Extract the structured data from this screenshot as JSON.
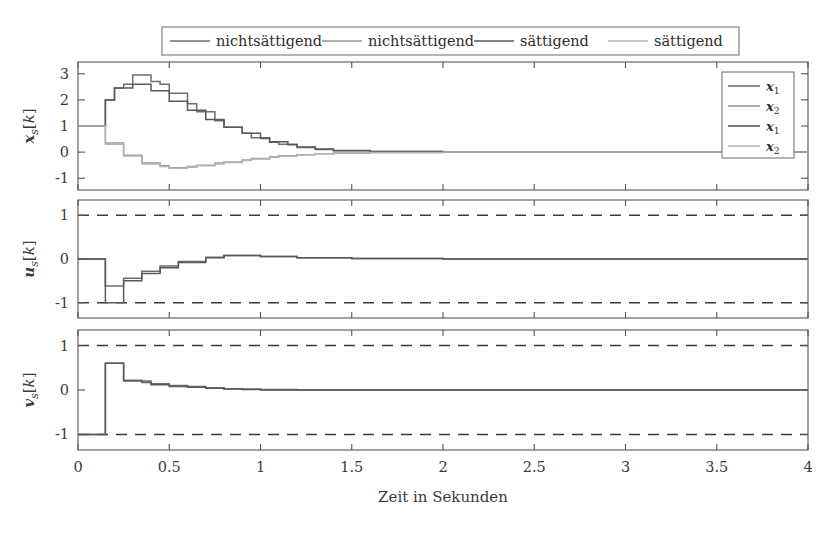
{
  "figure": {
    "width": 836,
    "height": 533,
    "background": "#ffffff",
    "xlabel": "Zeit in Sekunden"
  },
  "top_legend": {
    "entries": [
      {
        "label": "nichtsättigend",
        "color": "#6e6e6e"
      },
      {
        "label": "nichtsättigend",
        "color": "#9a9a9a"
      },
      {
        "label": "sättigend",
        "color": "#5a5a5a"
      },
      {
        "label": "sättigend",
        "color": "#b3b3b3"
      }
    ]
  },
  "inner_legend": {
    "entries": [
      {
        "label": "x1",
        "base": "x",
        "sub": "1",
        "color": "#6e6e6e"
      },
      {
        "label": "x2",
        "base": "x",
        "sub": "2",
        "color": "#9a9a9a"
      },
      {
        "label": "x1",
        "base": "x",
        "sub": "1",
        "color": "#5a5a5a"
      },
      {
        "label": "x2",
        "base": "x",
        "sub": "2",
        "color": "#b3b3b3"
      }
    ]
  },
  "chart_data": {
    "type": "line",
    "title": "",
    "xlabel": "Zeit in Sekunden",
    "xlim": [
      0,
      4
    ],
    "xticks": [
      0,
      0.5,
      1,
      1.5,
      2,
      2.5,
      3,
      3.5,
      4
    ],
    "xticklabels": [
      "0",
      "0.5",
      "1",
      "1.5",
      "2",
      "2.5",
      "3",
      "3.5",
      "4"
    ],
    "grid": false,
    "step_dt": 0.05,
    "legend_position": "top-outside / inner-upper-right",
    "subplots": [
      {
        "index": 0,
        "ylabel": "x_s[k]",
        "ylabel_base": "x",
        "ylabel_sub": "s",
        "ylabel_tail": "[k]",
        "ylim": [
          -1.45,
          3.45
        ],
        "yticks": [
          3,
          2,
          1,
          0,
          -1
        ],
        "yticklabels": [
          "3",
          "2",
          "1",
          "0",
          "-1"
        ],
        "drawstyle": "steps-post",
        "reference_lines": [],
        "series": [
          {
            "name": "x1 nichtsaettigend",
            "color": "#6e6e6e",
            "x": [
              0,
              0.1,
              0.15,
              0.2,
              0.25,
              0.3,
              0.35,
              0.4,
              0.45,
              0.5,
              0.55,
              0.6,
              0.65,
              0.7,
              0.75,
              0.8,
              0.85,
              0.9,
              0.95,
              1.0,
              1.05,
              1.1,
              1.15,
              1.2,
              1.3,
              1.4,
              1.6,
              2.0,
              3.0,
              4.0
            ],
            "y": [
              1.0,
              1.0,
              2.0,
              2.45,
              2.6,
              2.95,
              2.95,
              2.7,
              2.6,
              2.25,
              2.25,
              1.85,
              1.55,
              1.55,
              1.2,
              0.95,
              0.95,
              0.72,
              0.55,
              0.55,
              0.38,
              0.3,
              0.3,
              0.18,
              0.1,
              0.05,
              0.02,
              0.0,
              0.0,
              0.0
            ]
          },
          {
            "name": "x2 nichtsaettigend",
            "color": "#9a9a9a",
            "x": [
              0,
              0.1,
              0.15,
              0.2,
              0.25,
              0.3,
              0.35,
              0.4,
              0.45,
              0.5,
              0.55,
              0.6,
              0.65,
              0.7,
              0.75,
              0.8,
              0.85,
              0.9,
              0.95,
              1.0,
              1.05,
              1.1,
              1.2,
              1.3,
              1.4,
              1.6,
              2.0,
              3.0,
              4.0
            ],
            "y": [
              1.0,
              1.0,
              0.35,
              0.35,
              -0.12,
              -0.12,
              -0.42,
              -0.42,
              -0.52,
              -0.6,
              -0.6,
              -0.55,
              -0.5,
              -0.5,
              -0.42,
              -0.38,
              -0.38,
              -0.3,
              -0.24,
              -0.24,
              -0.18,
              -0.14,
              -0.1,
              -0.06,
              -0.03,
              -0.01,
              0.0,
              0.0,
              0.0
            ]
          },
          {
            "name": "x1 saettigend",
            "color": "#5a5a5a",
            "x": [
              0,
              0.1,
              0.15,
              0.2,
              0.25,
              0.3,
              0.35,
              0.4,
              0.45,
              0.5,
              0.55,
              0.6,
              0.65,
              0.7,
              0.75,
              0.8,
              0.85,
              0.9,
              0.95,
              1.0,
              1.05,
              1.1,
              1.15,
              1.2,
              1.3,
              1.4,
              1.6,
              2.0,
              3.0,
              4.0
            ],
            "y": [
              1.0,
              1.0,
              2.0,
              2.45,
              2.45,
              2.6,
              2.6,
              2.35,
              2.35,
              1.95,
              1.95,
              1.6,
              1.6,
              1.25,
              1.25,
              0.95,
              0.95,
              0.72,
              0.72,
              0.52,
              0.4,
              0.4,
              0.28,
              0.2,
              0.12,
              0.06,
              0.02,
              0.0,
              0.0,
              0.0
            ]
          },
          {
            "name": "x2 saettigend",
            "color": "#b3b3b3",
            "x": [
              0,
              0.1,
              0.15,
              0.2,
              0.25,
              0.3,
              0.35,
              0.4,
              0.45,
              0.5,
              0.55,
              0.6,
              0.65,
              0.7,
              0.75,
              0.8,
              0.85,
              0.9,
              0.95,
              1.0,
              1.05,
              1.1,
              1.2,
              1.3,
              1.4,
              1.6,
              2.0,
              3.0,
              4.0
            ],
            "y": [
              1.0,
              1.0,
              0.3,
              0.3,
              -0.15,
              -0.15,
              -0.45,
              -0.45,
              -0.55,
              -0.62,
              -0.62,
              -0.58,
              -0.52,
              -0.52,
              -0.45,
              -0.4,
              -0.4,
              -0.32,
              -0.26,
              -0.26,
              -0.2,
              -0.15,
              -0.1,
              -0.06,
              -0.03,
              -0.01,
              0.0,
              0.0,
              0.0
            ]
          }
        ]
      },
      {
        "index": 1,
        "ylabel": "u_s[k]",
        "ylabel_base": "u",
        "ylabel_sub": "s",
        "ylabel_tail": "[k]",
        "ylim": [
          -1.35,
          1.35
        ],
        "yticks": [
          1,
          0,
          -1
        ],
        "yticklabels": [
          "1",
          "0",
          "-1"
        ],
        "drawstyle": "steps-post",
        "reference_lines": [
          {
            "value": 1,
            "style": "dashed",
            "color": "#3a3a3a"
          },
          {
            "value": -1,
            "style": "dashed",
            "color": "#3a3a3a"
          }
        ],
        "series": [
          {
            "name": "u nichtsaettigend",
            "color": "#6e6e6e",
            "x": [
              0,
              0.1,
              0.15,
              0.2,
              0.25,
              0.3,
              0.35,
              0.4,
              0.45,
              0.5,
              0.55,
              0.6,
              0.7,
              0.8,
              0.9,
              1.0,
              1.2,
              1.5,
              2.0,
              3.0,
              4.0
            ],
            "y": [
              0.0,
              0.0,
              -0.62,
              -0.62,
              -0.44,
              -0.44,
              -0.28,
              -0.28,
              -0.16,
              -0.16,
              -0.06,
              -0.06,
              0.04,
              0.08,
              0.08,
              0.06,
              0.03,
              0.01,
              0.0,
              0.0,
              0.0
            ]
          },
          {
            "name": "u saettigend",
            "color": "#5a5a5a",
            "x": [
              0,
              0.1,
              0.15,
              0.2,
              0.25,
              0.3,
              0.35,
              0.4,
              0.45,
              0.5,
              0.55,
              0.6,
              0.7,
              0.8,
              0.9,
              1.0,
              1.2,
              1.5,
              2.0,
              3.0,
              4.0
            ],
            "y": [
              0.0,
              0.0,
              -1.0,
              -1.0,
              -0.5,
              -0.5,
              -0.33,
              -0.33,
              -0.2,
              -0.2,
              -0.08,
              -0.08,
              0.03,
              0.08,
              0.08,
              0.06,
              0.03,
              0.01,
              0.0,
              0.0,
              0.0
            ]
          }
        ]
      },
      {
        "index": 2,
        "ylabel": "v_s[k]",
        "ylabel_base": "v",
        "ylabel_sub": "s",
        "ylabel_tail": "[k]",
        "ylim": [
          -1.35,
          1.35
        ],
        "yticks": [
          1,
          0,
          -1
        ],
        "yticklabels": [
          "1",
          "0",
          "-1"
        ],
        "drawstyle": "steps-post",
        "reference_lines": [
          {
            "value": 1,
            "style": "dashed",
            "color": "#3a3a3a"
          },
          {
            "value": -1,
            "style": "dashed",
            "color": "#3a3a3a"
          }
        ],
        "series": [
          {
            "name": "v nichtsaettigend",
            "color": "#6e6e6e",
            "x": [
              0,
              0.1,
              0.15,
              0.2,
              0.25,
              0.3,
              0.35,
              0.4,
              0.45,
              0.5,
              0.6,
              0.7,
              0.8,
              0.9,
              1.0,
              1.2,
              1.5,
              2.0,
              3.0,
              4.0
            ],
            "y": [
              -1.0,
              -1.0,
              0.6,
              0.6,
              0.22,
              0.22,
              0.2,
              0.14,
              0.14,
              0.1,
              0.08,
              0.05,
              0.03,
              0.02,
              0.01,
              0.0,
              0.0,
              0.0,
              0.0,
              0.0
            ]
          },
          {
            "name": "v saettigend",
            "color": "#5a5a5a",
            "x": [
              0,
              0.1,
              0.15,
              0.2,
              0.25,
              0.3,
              0.35,
              0.4,
              0.45,
              0.5,
              0.6,
              0.7,
              0.8,
              0.9,
              1.0,
              1.2,
              1.5,
              2.0,
              3.0,
              4.0
            ],
            "y": [
              -1.0,
              -1.0,
              0.6,
              0.6,
              0.2,
              0.2,
              0.17,
              0.12,
              0.12,
              0.08,
              0.06,
              0.04,
              0.02,
              0.01,
              0.0,
              0.0,
              0.0,
              0.0,
              0.0,
              0.0
            ]
          }
        ]
      }
    ]
  }
}
